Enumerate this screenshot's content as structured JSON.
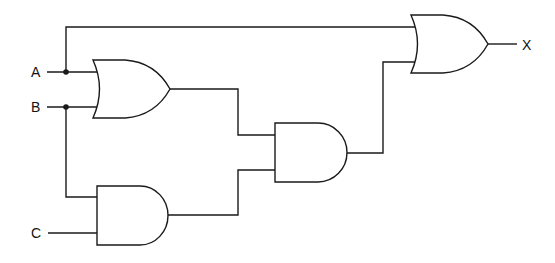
{
  "diagram": {
    "type": "logic-circuit",
    "inputs": [
      {
        "id": "A",
        "label": "A"
      },
      {
        "id": "B",
        "label": "B"
      },
      {
        "id": "C",
        "label": "C"
      }
    ],
    "outputs": [
      {
        "id": "X",
        "label": "X"
      }
    ],
    "gates": [
      {
        "id": "or1",
        "type": "OR",
        "inputs": [
          "A",
          "B"
        ]
      },
      {
        "id": "and1",
        "type": "AND",
        "inputs": [
          "B",
          "C"
        ]
      },
      {
        "id": "and2",
        "type": "AND",
        "inputs": [
          "or1",
          "and1"
        ]
      },
      {
        "id": "or2",
        "type": "OR",
        "inputs": [
          "A",
          "and2"
        ],
        "output": "X"
      }
    ],
    "expression": "X = A + (A + B)(B C)"
  },
  "labels": {
    "a": "A",
    "b": "B",
    "c": "C",
    "x": "X"
  }
}
